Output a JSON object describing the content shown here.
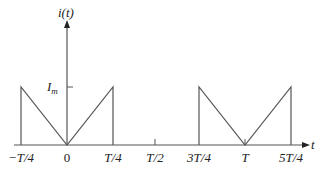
{
  "diagram": {
    "type": "waveform",
    "y_axis_label": "i(t)",
    "x_axis_label": "t",
    "amplitude_label": "I",
    "amplitude_subscript": "m",
    "line_color": "#555555",
    "x_ticks": [
      {
        "label": "−T/4",
        "x": 21
      },
      {
        "label": "0",
        "x": 67
      },
      {
        "label": "T/4",
        "x": 113
      },
      {
        "label": "T/2",
        "x": 155
      },
      {
        "label": "3T/4",
        "x": 199
      },
      {
        "label": "T",
        "x": 245
      },
      {
        "label": "5T/4",
        "x": 291
      }
    ]
  }
}
